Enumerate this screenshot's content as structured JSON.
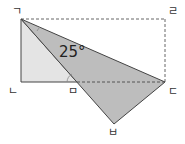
{
  "diagram": {
    "type": "geometry-fold",
    "points": {
      "top_left": {
        "label": "ㄱ",
        "x": 21,
        "y": 19
      },
      "top_right": {
        "label": "ㄹ",
        "x": 165,
        "y": 19
      },
      "bottom_left": {
        "label": "ㄴ",
        "x": 21,
        "y": 82
      },
      "middle": {
        "label": "ㅁ",
        "x": 77,
        "y": 82
      },
      "right": {
        "label": "ㄷ",
        "x": 165,
        "y": 82
      },
      "bottom": {
        "label": "ㅂ",
        "x": 114,
        "y": 124
      }
    },
    "angle_label": "25°",
    "colors": {
      "light_fill": "#e4e4e4",
      "dark_fill": "#bdbdbd",
      "stroke": "#444444",
      "dashed": "#666666"
    }
  }
}
